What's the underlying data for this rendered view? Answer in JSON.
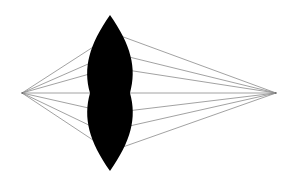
{
  "diagram": {
    "type": "converging-lens-ray-diagram",
    "canvas": {
      "width": 295,
      "height": 184,
      "background": "#ffffff"
    },
    "colors": {
      "lens": "#000000",
      "rays": "#8a8a8a"
    },
    "left_point": {
      "x": 22,
      "y": 93
    },
    "right_point": {
      "x": 276,
      "y": 93
    },
    "lens": {
      "center_x": 110,
      "top_y": 15,
      "bottom_y": 171,
      "half_width": 20
    },
    "rays_left_hit_y": [
      40,
      61,
      73,
      93,
      109,
      128,
      146
    ],
    "rays_left_hit_x": [
      102,
      93,
      91,
      90,
      91,
      93,
      100
    ],
    "rays_right_hit_y": [
      35,
      56,
      70,
      93,
      111,
      127,
      148
    ],
    "rays_right_hit_x": [
      120,
      127,
      129,
      130,
      129,
      127,
      122
    ]
  }
}
